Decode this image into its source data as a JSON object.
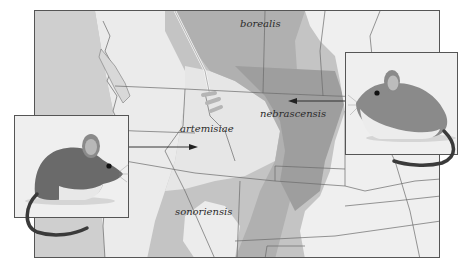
{
  "map": {
    "title": "Subspecies ranges",
    "regions": [
      {
        "id": "borealis",
        "label": "borealis"
      },
      {
        "id": "nebrascensis",
        "label": "nebrascensis"
      },
      {
        "id": "artemisiae",
        "label": "artemisiae"
      },
      {
        "id": "sonoriensis",
        "label": "sonoriensis"
      }
    ],
    "colors": {
      "ocean_land_light": "#f0f0f0",
      "range_mid": "#c2c2c2",
      "range_dark": "#a8a8a8",
      "border_line": "#666666"
    }
  },
  "insets": [
    {
      "id": "left",
      "subject": "mouse illustration",
      "points_to": "artemisiae"
    },
    {
      "id": "right",
      "subject": "mouse illustration",
      "points_to": "nebrascensis"
    }
  ]
}
